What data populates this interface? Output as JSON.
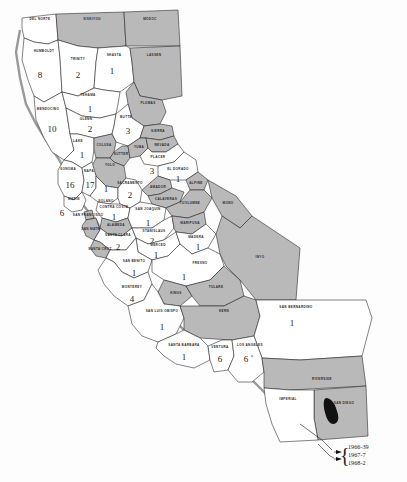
{
  "map": {
    "title": "California counties",
    "legend": {
      "entries": [
        {
          "label": "1966-39"
        },
        {
          "label": "1967-7"
        },
        {
          "label": "1968-2"
        }
      ]
    },
    "counties": [
      {
        "id": "del-norte",
        "name": "DEL NORTE",
        "value": "",
        "shaded": false
      },
      {
        "id": "siskiyou",
        "name": "SISKIYOU",
        "value": "",
        "shaded": true
      },
      {
        "id": "modoc",
        "name": "MODOC",
        "value": "",
        "shaded": true
      },
      {
        "id": "humboldt",
        "name": "HUMBOLDT",
        "value": "8",
        "shaded": false
      },
      {
        "id": "trinity",
        "name": "TRINITY",
        "value": "2",
        "shaded": false
      },
      {
        "id": "shasta",
        "name": "SHASTA",
        "value": "1",
        "shaded": false
      },
      {
        "id": "lassen",
        "name": "LASSEN",
        "value": "",
        "shaded": true
      },
      {
        "id": "tehama",
        "name": "TEHAMA",
        "value": "1",
        "shaded": false
      },
      {
        "id": "plumas",
        "name": "PLUMAS",
        "value": "",
        "shaded": true
      },
      {
        "id": "mendocino",
        "name": "MENDOCINO",
        "value": "10",
        "shaded": false
      },
      {
        "id": "glenn",
        "name": "GLENN",
        "value": "2",
        "shaded": false
      },
      {
        "id": "butte",
        "name": "BUTTE",
        "value": "3",
        "shaded": false
      },
      {
        "id": "sierra",
        "name": "SIERRA",
        "value": "",
        "shaded": true
      },
      {
        "id": "lake",
        "name": "LAKE",
        "value": "1",
        "shaded": false
      },
      {
        "id": "colusa",
        "name": "COLUSA",
        "value": "",
        "shaded": true
      },
      {
        "id": "sutter",
        "name": "SUTTER",
        "value": "",
        "shaded": true
      },
      {
        "id": "yuba",
        "name": "YUBA",
        "value": "",
        "shaded": true
      },
      {
        "id": "nevada",
        "name": "NEVADA",
        "value": "",
        "shaded": true
      },
      {
        "id": "placer",
        "name": "PLACER",
        "value": "3",
        "shaded": false
      },
      {
        "id": "el-dorado",
        "name": "EL DORADO",
        "value": "1",
        "shaded": false
      },
      {
        "id": "yolo",
        "name": "YOLO",
        "value": "",
        "shaded": true
      },
      {
        "id": "sonoma",
        "name": "SONOMA",
        "value": "16",
        "shaded": false
      },
      {
        "id": "napa",
        "name": "NAPA",
        "value": "17",
        "shaded": false
      },
      {
        "id": "solano",
        "name": "SOLANO",
        "value": "1",
        "shaded": false
      },
      {
        "id": "sacramento",
        "name": "SACRAMENTO",
        "value": "2",
        "shaded": false
      },
      {
        "id": "amador",
        "name": "AMADOR",
        "value": "",
        "shaded": true
      },
      {
        "id": "alpine",
        "name": "ALPINE",
        "value": "",
        "shaded": true
      },
      {
        "id": "calaveras",
        "name": "CALAVERAS",
        "value": "",
        "shaded": true
      },
      {
        "id": "marin",
        "name": "MARIN",
        "value": "6",
        "shaded": false
      },
      {
        "id": "contra-costa",
        "name": "CONTRA COSTA",
        "value": "1",
        "shaded": false
      },
      {
        "id": "san-francisco",
        "name": "SAN FRANCISCO",
        "value": "",
        "shaded": true
      },
      {
        "id": "san-mateo",
        "name": "SAN MATEO",
        "value": "",
        "shaded": true
      },
      {
        "id": "alameda",
        "name": "ALAMEDA",
        "value": "",
        "shaded": true
      },
      {
        "id": "san-joaquin",
        "name": "SAN JOAQUIN",
        "value": "1",
        "shaded": false
      },
      {
        "id": "tuolumne",
        "name": "TUOLUMNE",
        "value": "",
        "shaded": true
      },
      {
        "id": "mono",
        "name": "MONO",
        "value": "",
        "shaded": true
      },
      {
        "id": "santa-clara",
        "name": "SANTA CLARA",
        "value": "2",
        "shaded": false
      },
      {
        "id": "stanislaus",
        "name": "STANISLAUS",
        "value": "2",
        "shaded": false
      },
      {
        "id": "mariposa",
        "name": "MARIPOSA",
        "value": "",
        "shaded": true
      },
      {
        "id": "santa-cruz",
        "name": "SANTA CRUZ",
        "value": "",
        "shaded": true
      },
      {
        "id": "merced",
        "name": "MERCED",
        "value": "1",
        "shaded": false
      },
      {
        "id": "madera",
        "name": "MADERA",
        "value": "1",
        "shaded": false
      },
      {
        "id": "san-benito",
        "name": "SAN BENITO",
        "value": "1",
        "shaded": false
      },
      {
        "id": "fresno",
        "name": "FRESNO",
        "value": "1",
        "shaded": false
      },
      {
        "id": "inyo",
        "name": "INYO",
        "value": "",
        "shaded": true
      },
      {
        "id": "monterey",
        "name": "MONTEREY",
        "value": "4",
        "shaded": false
      },
      {
        "id": "kings",
        "name": "KINGS",
        "value": "",
        "shaded": true
      },
      {
        "id": "tulare",
        "name": "TULARE",
        "value": "",
        "shaded": true
      },
      {
        "id": "san-luis-obispo",
        "name": "SAN LUIS OBISPO",
        "value": "1",
        "shaded": false
      },
      {
        "id": "kern",
        "name": "KERN",
        "value": "",
        "shaded": true
      },
      {
        "id": "san-bernardino",
        "name": "SAN BERNARDINO",
        "value": "1",
        "shaded": false
      },
      {
        "id": "santa-barbara",
        "name": "SANTA BARBARA",
        "value": "1",
        "shaded": false
      },
      {
        "id": "ventura",
        "name": "VENTURA",
        "value": "6",
        "shaded": false
      },
      {
        "id": "los-angeles",
        "name": "LOS ANGELES",
        "value": "6",
        "superscript": "a",
        "shaded": false
      },
      {
        "id": "riverside",
        "name": "RIVERSIDE",
        "value": "",
        "shaded": true
      },
      {
        "id": "san-diego",
        "name": "SAN DIEGO",
        "value": "48",
        "shaded": false
      },
      {
        "id": "imperial",
        "name": "IMPERIAL",
        "value": "",
        "shaded": true
      }
    ]
  }
}
